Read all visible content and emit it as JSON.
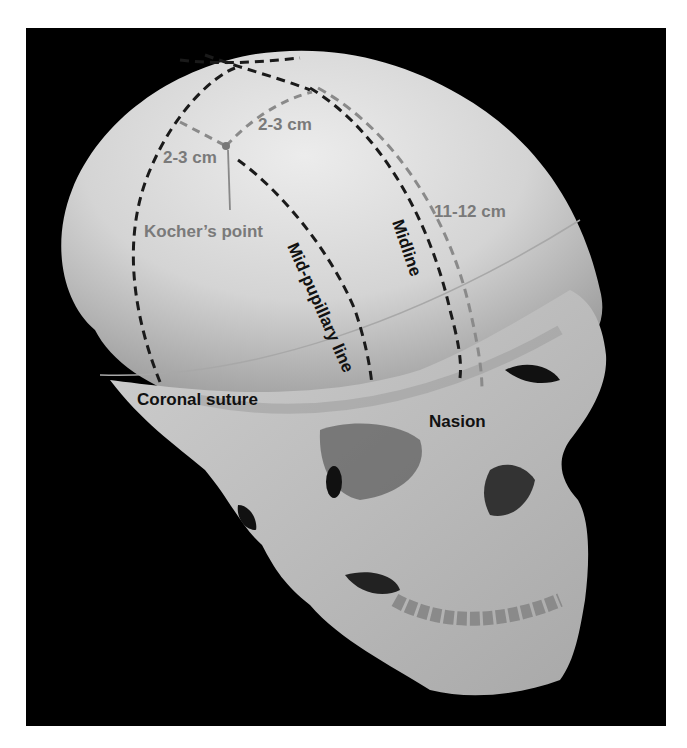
{
  "figure": {
    "background_color": "#000000",
    "page_color": "#ffffff",
    "colors": {
      "skull": "#d8d8d8",
      "dark_label": "#111111",
      "gray_label": "#7a7a7a",
      "dark_dash": "#1a1a1a",
      "gray_dash": "#8a8a8a",
      "kocher_point_marker": "#777777"
    }
  },
  "labels": {
    "kochers_point": "Kocher’s point",
    "dist_left": "2-3 cm",
    "dist_right": "2-3 cm",
    "dist_nasion": "11-12 cm",
    "midline": "Midline",
    "mid_pupillary": "Mid-pupillary line",
    "coronal_suture": "Coronal suture",
    "nasion": "Nasion"
  }
}
